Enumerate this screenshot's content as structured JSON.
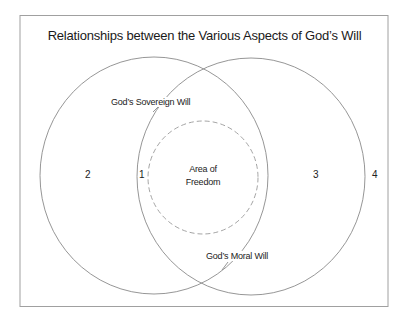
{
  "title": "Relationships between the Various Aspects of God’s Will",
  "labels": {
    "sovereign_will": "God’s Sovereign Will",
    "moral_will": "God’s Moral Will",
    "freedom_line1": "Area of",
    "freedom_line2": "Freedom"
  },
  "regions": {
    "r1": "1",
    "r2": "2",
    "r3": "3",
    "r4": "4"
  },
  "colors": {
    "stroke": "#888888",
    "frame": "#9a9a9a",
    "text": "#222222"
  }
}
